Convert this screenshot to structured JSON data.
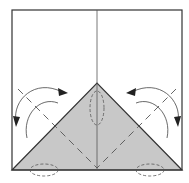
{
  "diagram": {
    "type": "origami-fold-step",
    "colors": {
      "paper": "#ffffff",
      "shaded": "#c8c8c8",
      "line": "#333333",
      "arrow": "#444444",
      "dash": "#555555"
    },
    "elements": [
      "square-outline",
      "center-crease",
      "shaded-triangle",
      "left-valley-fold",
      "right-valley-fold",
      "left-fold-arrow",
      "right-fold-arrow",
      "center-circle-marker",
      "left-bottom-marker",
      "right-bottom-marker"
    ]
  }
}
